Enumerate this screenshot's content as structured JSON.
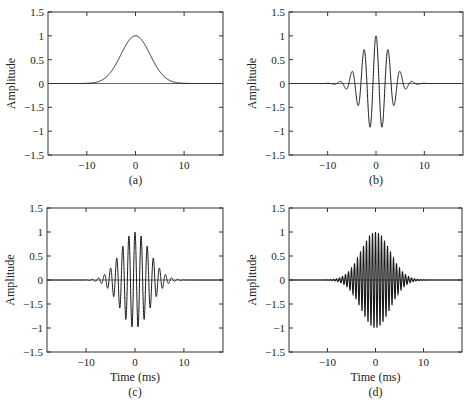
{
  "figure": {
    "panels": [
      {
        "id": "a",
        "label": "(a)",
        "ylabel": "Amplitude",
        "xlabel": "",
        "box": [
          48,
          12,
          223,
          155
        ]
      },
      {
        "id": "b",
        "label": "(b)",
        "ylabel": "Amplitude",
        "xlabel": "",
        "box": [
          289,
          12,
          463,
          155
        ]
      },
      {
        "id": "c",
        "label": "(c)",
        "ylabel": "Amplitude",
        "xlabel": "Time (ms)",
        "box": [
          47,
          208,
          223,
          352
        ]
      },
      {
        "id": "d",
        "label": "(d)",
        "ylabel": "Amplitude",
        "xlabel": "Time (ms)",
        "box": [
          289,
          208,
          462,
          352
        ]
      }
    ],
    "xticks": [
      -10,
      0,
      10
    ],
    "xtick_labels": [
      "−10",
      "0",
      "10"
    ],
    "yticks": [
      1.5,
      1,
      0.5,
      0,
      -0.5,
      -1,
      -1.5
    ],
    "ytick_labels": [
      "1.5",
      "1",
      "0.5",
      "0",
      "−1.5",
      "−1",
      "−1.5"
    ]
  },
  "chart_data": [
    {
      "type": "line",
      "panel": "(a)",
      "title": "",
      "xlabel": "",
      "ylabel": "Amplitude",
      "xlim": [
        -18,
        18
      ],
      "ylim": [
        -1.5,
        1.5
      ],
      "grid": false,
      "series": [
        {
          "name": "Gaussian envelope",
          "function": "exp(-t^2/(2*3^2))",
          "envelope_sigma_ms": 3,
          "carrier_freq_khz": 0,
          "peak": 1.0
        }
      ],
      "x": [
        -18,
        -9,
        -6,
        -3,
        0,
        3,
        6,
        9,
        18
      ],
      "values": [
        0,
        0.01,
        0.14,
        0.61,
        1.0,
        0.61,
        0.14,
        0.01,
        0
      ]
    },
    {
      "type": "line",
      "panel": "(b)",
      "title": "",
      "xlabel": "",
      "ylabel": "Amplitude",
      "xlim": [
        -18,
        18
      ],
      "ylim": [
        -1.5,
        1.5
      ],
      "grid": false,
      "series": [
        {
          "name": "Gabor pulse 0.4 kHz",
          "function": "exp(-t^2/(2*3^2))*cos(2*pi*0.4*t)",
          "envelope_sigma_ms": 3,
          "carrier_freq_khz": 0.4,
          "peak": 1.0
        }
      ],
      "x": [
        -5,
        -3.75,
        -2.5,
        -1.25,
        0,
        1.25,
        2.5,
        3.75,
        5
      ],
      "values": [
        0.2,
        -0.45,
        0.7,
        -0.92,
        1.0,
        -0.92,
        0.7,
        -0.45,
        0.2
      ]
    },
    {
      "type": "line",
      "panel": "(c)",
      "title": "",
      "xlabel": "Time (ms)",
      "ylabel": "Amplitude",
      "xlim": [
        -18,
        18
      ],
      "ylim": [
        -1.5,
        1.5
      ],
      "grid": false,
      "series": [
        {
          "name": "Gabor pulse 0.8 kHz",
          "function": "exp(-t^2/(2*3^2))*cos(2*pi*0.8*t)",
          "envelope_sigma_ms": 3,
          "carrier_freq_khz": 0.8,
          "peak": 1.0
        }
      ],
      "x": [
        -6.25,
        -5,
        -3.75,
        -2.5,
        -1.25,
        0,
        1.25,
        2.5,
        3.75,
        5,
        6.25
      ],
      "values": [
        0.11,
        0.25,
        0.46,
        0.71,
        0.92,
        1.0,
        0.92,
        0.71,
        0.46,
        0.25,
        0.11
      ]
    },
    {
      "type": "line",
      "panel": "(d)",
      "title": "",
      "xlabel": "Time (ms)",
      "ylabel": "Amplitude",
      "xlim": [
        -18,
        18
      ],
      "ylim": [
        -1.5,
        1.5
      ],
      "grid": false,
      "series": [
        {
          "name": "Gabor pulse 1.6 kHz",
          "function": "exp(-t^2/(2*3^2))*cos(2*pi*1.6*t)",
          "envelope_sigma_ms": 3,
          "carrier_freq_khz": 1.6,
          "peak": 1.0
        }
      ],
      "x": [
        -6.25,
        -5,
        -3.75,
        -2.5,
        -1.25,
        0,
        1.25,
        2.5,
        3.75,
        5,
        6.25
      ],
      "values": [
        0.11,
        0.25,
        0.46,
        0.71,
        0.92,
        1.0,
        0.92,
        0.71,
        0.46,
        0.25,
        0.11
      ]
    }
  ]
}
